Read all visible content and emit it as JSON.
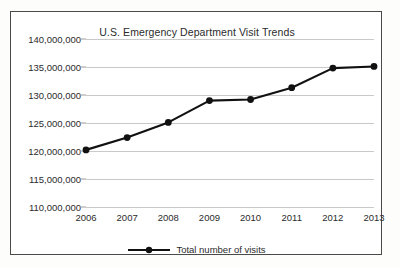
{
  "chart_data": {
    "type": "line",
    "title": "U.S. Emergency Department Visit Trends",
    "xlabel": "",
    "ylabel": "",
    "categories": [
      "2006",
      "2007",
      "2008",
      "2009",
      "2010",
      "2011",
      "2012",
      "2013"
    ],
    "series": [
      {
        "name": "Total number of visits",
        "values": [
          120200000,
          122400000,
          125100000,
          129000000,
          129200000,
          131300000,
          134800000,
          135100000
        ]
      }
    ],
    "ylim": [
      110000000,
      140000000
    ],
    "ytick_step": 5000000,
    "ytick_labels": [
      "140,000,000",
      "135,000,000",
      "130,000,000",
      "125,000,000",
      "120,000,000",
      "115,000,000",
      "110,000,000"
    ],
    "ytick_values": [
      140000000,
      135000000,
      130000000,
      125000000,
      120000000,
      115000000,
      110000000
    ],
    "grid": "horizontal",
    "legend_position": "bottom-center",
    "line_color": "#111111",
    "marker_color": "#111111",
    "grid_color": "#c9c9c9",
    "border_color": "#4a4a4a",
    "background_color": "#ffffff"
  },
  "legend": {
    "label": "Total number of visits",
    "symbol": "line-marker-symbol"
  }
}
